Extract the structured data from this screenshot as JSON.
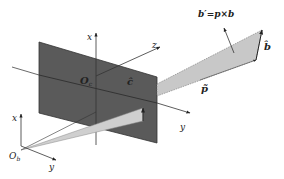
{
  "diagram": {
    "labels": {
      "camera_x_axis": "x",
      "camera_z_axis": "z",
      "camera_y_axis": "y",
      "camera_origin": "O",
      "camera_origin_sub": "c",
      "c_hat": "ĉ",
      "b_prime": "b′=p×b",
      "b_hat": "b̂",
      "p_tilde": "p̃",
      "body_x_axis": "x",
      "body_y_axis": "y",
      "body_origin": "O",
      "body_origin_sub": "b"
    },
    "colors": {
      "image_plane": "#5a5a5a",
      "plane_edge": "#333333",
      "light_wedge": "#c8c8c8",
      "axis": "#333333",
      "background": "#ffffff"
    }
  }
}
